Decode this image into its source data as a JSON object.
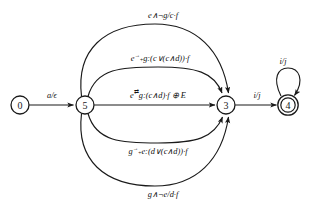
{
  "diagram": {
    "background_color": "#ffffff",
    "stroke_color": "#1a1a1a",
    "states": [
      {
        "id": "0",
        "label": "0",
        "kind": "start",
        "cx": 20,
        "cy": 105,
        "r": 9
      },
      {
        "id": "5",
        "label": "5",
        "kind": "normal",
        "cx": 85,
        "cy": 105,
        "r": 9
      },
      {
        "id": "3",
        "label": "3",
        "kind": "normal",
        "cx": 226,
        "cy": 105,
        "r": 9
      },
      {
        "id": "4",
        "label": "4",
        "kind": "accepting",
        "cx": 288,
        "cy": 105,
        "r": 9.5
      }
    ],
    "transitions": [
      {
        "id": "t0",
        "from": "0",
        "to": "5",
        "label": "a/ϵ",
        "shape": "straight",
        "label_x": 52,
        "label_y": 95
      },
      {
        "id": "t1",
        "from": "5",
        "to": "3",
        "label": "e∧¬g/c·f",
        "shape": "arc-up-outer",
        "label_x": 163,
        "label_y": 15
      },
      {
        "id": "t2",
        "from": "5",
        "to": "3",
        "label_prefix": "e",
        "label_sup": "→",
        "label_sub": "+",
        "label_suffix": "g:(c∨(c∧d))·f",
        "label": "e→+g:(c∨(c∧d))·f",
        "shape": "arc-up-inner",
        "label_x": 160,
        "label_y": 58
      },
      {
        "id": "t3",
        "from": "5",
        "to": "3",
        "label_prefix": "e",
        "label_sup": "⇄",
        "label_sub": "",
        "label_suffix": "g:(c∧d)·f ⊕ E",
        "label": "e⇄g:(c∧d)·f ⊕ E",
        "shape": "straight",
        "label_x": 158,
        "label_y": 95
      },
      {
        "id": "t4",
        "from": "5",
        "to": "3",
        "label_prefix": "g",
        "label_sup": "→",
        "label_sub": "+",
        "label_suffix": "e:(d∨(c∧d))·f",
        "label": "g→+e:(d∨(c∧d))·f",
        "shape": "arc-down-inner",
        "label_x": 158,
        "label_y": 151
      },
      {
        "id": "t5",
        "from": "5",
        "to": "3",
        "label": "g∧¬e/d·f",
        "shape": "arc-down-outer",
        "label_x": 163,
        "label_y": 194
      },
      {
        "id": "t6",
        "from": "3",
        "to": "4",
        "label": "i/j",
        "shape": "straight",
        "label_x": 257,
        "label_y": 95
      },
      {
        "id": "t7",
        "from": "4",
        "to": "4",
        "label": "i/j",
        "shape": "self-loop",
        "label_x": 283,
        "label_y": 62
      }
    ]
  }
}
